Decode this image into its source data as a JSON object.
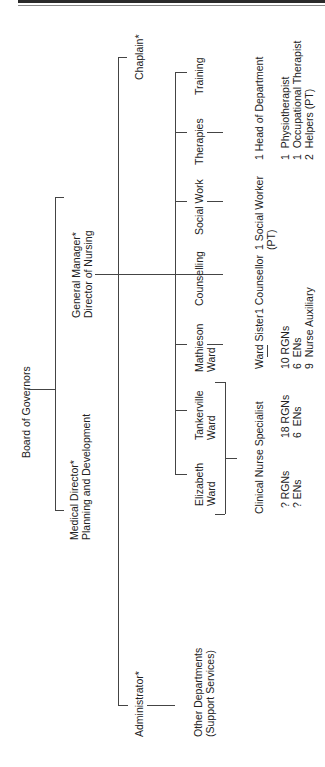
{
  "chart": {
    "root": "Board of Governors",
    "medical_director": "Medical Director*",
    "medical_director_sub": "Planning and Development",
    "general_manager": "General Manager*",
    "general_manager_sub": "Director of Nursing",
    "chaplain": "Chaplain*",
    "administrator": "Administrator*",
    "other_departments": "Other Departments",
    "other_departments_sub": "(Support Services)",
    "units": {
      "elizabeth": "Elizabeth",
      "elizabeth_sub": "Ward",
      "tankerville": "Tankerville",
      "tankerville_sub": "Ward",
      "mathieson": "Mathieson",
      "mathieson_sub": "Ward",
      "counselling": "Counselling",
      "social_work": "Social Work",
      "therapies": "Therapies",
      "training": "Training"
    },
    "staff": {
      "clinical_nurse_specialist": "Clinical Nurse Specialist",
      "eliz_rgns": "? RGNs",
      "eliz_ens": "? ENs",
      "tank_rgns": "18 RGNs",
      "tank_ens": "6  ENs",
      "ward_sister": "Ward Sister",
      "math_rgns": "10 RGNs",
      "math_ens": "6  ENs",
      "math_aux": "9  Nurse Auxiliary",
      "counsellor": "1 Counsellor",
      "social_worker": "1 Social Worker",
      "social_worker_sub": "(PT)",
      "head_of_department": "1 Head of Department",
      "physio": "1  Physiotherapist",
      "ot": "1  Occupational Therapist",
      "helpers": "2  Helpers (PT)"
    }
  }
}
